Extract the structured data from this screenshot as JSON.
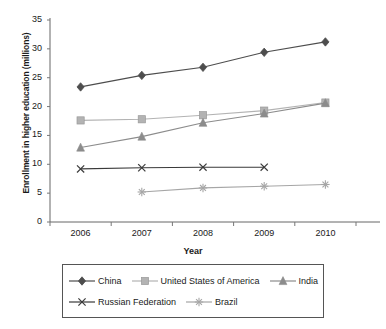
{
  "chart_data": {
    "type": "line",
    "title": "",
    "xlabel": "Year",
    "ylabel": "Enrollment in higher education (millions)",
    "x": [
      2006,
      2007,
      2008,
      2009,
      2010
    ],
    "xticklabels": [
      "2006",
      "2007",
      "2008",
      "2009",
      "2010"
    ],
    "yticklabels": [
      "0",
      "5",
      "10",
      "15",
      "20",
      "25",
      "30",
      "35"
    ],
    "ylim": [
      0,
      35
    ],
    "ytick_step": 5,
    "grid": false,
    "legend_position": "bottom",
    "series": [
      {
        "name": "China",
        "marker": "diamond",
        "color": "#4d4d4d",
        "x": [
          2006,
          2007,
          2008,
          2009,
          2010
        ],
        "values": [
          23.4,
          25.4,
          26.8,
          29.4,
          31.2
        ]
      },
      {
        "name": "United States of America",
        "marker": "square",
        "color": "#b3b3b3",
        "x": [
          2006,
          2007,
          2008,
          2009,
          2010
        ],
        "values": [
          17.6,
          17.8,
          18.5,
          19.3,
          20.7
        ]
      },
      {
        "name": "India",
        "marker": "triangle",
        "color": "#8c8c8c",
        "x": [
          2006,
          2007,
          2008,
          2009,
          2010
        ],
        "values": [
          12.9,
          14.8,
          17.2,
          18.8,
          20.6
        ]
      },
      {
        "name": "Russian Federation",
        "marker": "x",
        "color": "#3a3a3a",
        "x": [
          2006,
          2007,
          2008,
          2009
        ],
        "values": [
          9.2,
          9.4,
          9.5,
          9.5
        ]
      },
      {
        "name": "Brazil",
        "marker": "star",
        "color": "#a6a6a6",
        "x": [
          2007,
          2008,
          2009,
          2010
        ],
        "values": [
          5.2,
          5.9,
          6.2,
          6.5
        ]
      }
    ]
  },
  "legend": {
    "rows": [
      [
        "China",
        "United States of America",
        "India"
      ],
      [
        "Russian Federation",
        "Brazil"
      ]
    ]
  },
  "axes": {
    "ylabel": "Enrollment in higher education (millions)",
    "xlabel": "Year"
  }
}
